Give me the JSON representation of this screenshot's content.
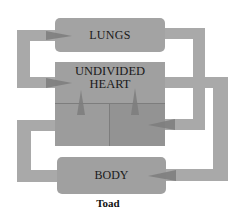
{
  "diagram": {
    "title": "Toad",
    "nodes": {
      "lungs": "LUNGS",
      "heart_line1": "UNDIVIDED",
      "heart_line2": "HEART",
      "body": "BODY"
    },
    "edges": [
      {
        "from": "lungs",
        "to": "heart",
        "side": "left"
      },
      {
        "from": "lungs",
        "to": "heart",
        "side": "right-inner"
      },
      {
        "from": "heart",
        "to": "body",
        "side": "right-outer"
      },
      {
        "from": "body",
        "to": "lungs",
        "side": "left-lower"
      }
    ],
    "colors": {
      "pipe": "#a9a9a9",
      "box": "#a0a0a0",
      "arrow": "#7a7a7a",
      "text": "#1a1a1a"
    }
  }
}
